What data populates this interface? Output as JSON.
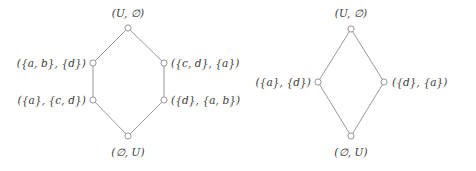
{
  "figure": {
    "name": "two-hasse-diagrams",
    "background_color": "#ffffff",
    "line_color": "#8d8d8d",
    "node_fill_color": "#ffffff",
    "node_stroke_color": "#8a8a8a",
    "text_color": "#3b3b3b"
  },
  "diagrams": [
    {
      "id": "left-lattice",
      "nodes": [
        {
          "id": "l-top",
          "label": "(U, ∅)",
          "x": 128,
          "y": 28,
          "label_x": 128,
          "label_y": 13,
          "anchor": "center"
        },
        {
          "id": "l-upper-left",
          "label": "({a, b}, {d})",
          "x": 93,
          "y": 63,
          "label_x": 86,
          "label_y": 63,
          "anchor": "left-of"
        },
        {
          "id": "l-upper-right",
          "label": "({c, d}, {a})",
          "x": 164,
          "y": 63,
          "label_x": 171,
          "label_y": 63,
          "anchor": "right-of"
        },
        {
          "id": "l-lower-left",
          "label": "({a}, {c, d})",
          "x": 93,
          "y": 100,
          "label_x": 86,
          "label_y": 100,
          "anchor": "left-of"
        },
        {
          "id": "l-lower-right",
          "label": "({d}, {a, b})",
          "x": 164,
          "y": 100,
          "label_x": 171,
          "label_y": 100,
          "anchor": "right-of"
        },
        {
          "id": "l-bottom",
          "label": "(∅, U)",
          "x": 128,
          "y": 136,
          "label_x": 128,
          "label_y": 152,
          "anchor": "center"
        }
      ],
      "edges": [
        {
          "from": "l-top",
          "to": "l-upper-left"
        },
        {
          "from": "l-top",
          "to": "l-upper-right"
        },
        {
          "from": "l-upper-left",
          "to": "l-lower-left"
        },
        {
          "from": "l-upper-right",
          "to": "l-lower-right"
        },
        {
          "from": "l-lower-left",
          "to": "l-bottom"
        },
        {
          "from": "l-lower-right",
          "to": "l-bottom"
        }
      ]
    },
    {
      "id": "right-lattice",
      "nodes": [
        {
          "id": "r-top",
          "label": "(U, ∅)",
          "x": 351,
          "y": 29,
          "label_x": 351,
          "label_y": 13,
          "anchor": "center"
        },
        {
          "id": "r-left",
          "label": "({a}, {d})",
          "x": 318,
          "y": 82,
          "label_x": 311,
          "label_y": 82,
          "anchor": "left-of"
        },
        {
          "id": "r-right",
          "label": "({d}, {a})",
          "x": 384,
          "y": 82,
          "label_x": 392,
          "label_y": 82,
          "anchor": "right-of"
        },
        {
          "id": "r-bottom",
          "label": "(∅, U)",
          "x": 351,
          "y": 136,
          "label_x": 351,
          "label_y": 152,
          "anchor": "center"
        }
      ],
      "edges": [
        {
          "from": "r-top",
          "to": "r-left"
        },
        {
          "from": "r-top",
          "to": "r-right"
        },
        {
          "from": "r-left",
          "to": "r-bottom"
        },
        {
          "from": "r-right",
          "to": "r-bottom"
        }
      ]
    }
  ]
}
